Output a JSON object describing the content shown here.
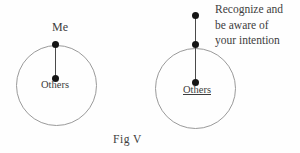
{
  "figure": {
    "caption": "Fig V",
    "left_diagram": {
      "top_label": "Me",
      "center_label": "Others"
    },
    "right_diagram": {
      "center_label": "Others",
      "annotation": "Recognize and be aware of your intention",
      "annotation_lines": [
        "Recognize and",
        "be aware of",
        "your intention"
      ]
    },
    "colors": {
      "background": "#fefefe",
      "text": "#3d3d3d",
      "dot": "#151515",
      "circle_outline": "#9a9a9a",
      "connector_line": "#4a4a4a"
    }
  }
}
